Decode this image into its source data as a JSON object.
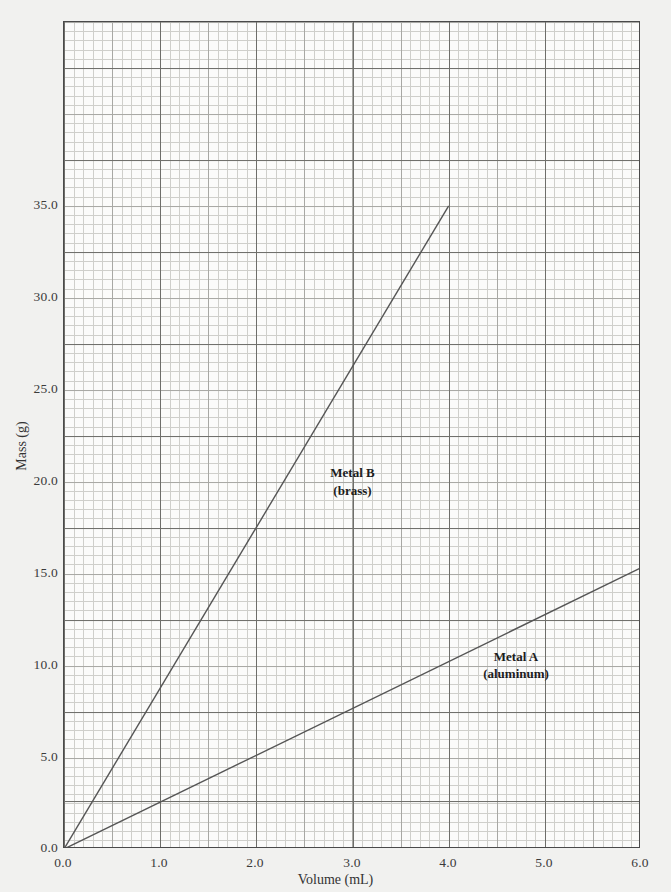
{
  "figure": {
    "background_color": "#f1f1ef",
    "plot_background_color": "#fbfbfa",
    "frame_color": "#4a4a4a"
  },
  "chart_data": {
    "type": "line",
    "title": "",
    "subtitle": "",
    "xlabel": "Volume (mL)",
    "ylabel": "Mass (g)",
    "xlim": [
      0.0,
      6.0
    ],
    "ylim": [
      0.0,
      45.0
    ],
    "xticks": [
      "0.0",
      "1.0",
      "2.0",
      "3.0",
      "4.0",
      "5.0",
      "6.0"
    ],
    "xtick_values": [
      0.0,
      1.0,
      2.0,
      3.0,
      4.0,
      5.0,
      6.0
    ],
    "yticks": [
      "0.0",
      "5.0",
      "10.0",
      "15.0",
      "20.0",
      "25.0",
      "30.0",
      "35.0"
    ],
    "ytick_values": [
      0.0,
      5.0,
      10.0,
      15.0,
      20.0,
      25.0,
      30.0,
      35.0
    ],
    "grid": "graph-paper: minor 0.1 mL / 0.5 g, medium every 0.5 mL / 2.5 g, major at labeled ticks",
    "legend_position": "inline annotations next to each line",
    "line_color": "#555555",
    "series": [
      {
        "name": "Metal B (brass)",
        "label_line1": "Metal B",
        "label_line2": "(brass)",
        "x": [
          0.0,
          4.0
        ],
        "values": [
          0.0,
          35.0
        ],
        "slope": 8.75,
        "slope_units": "g/mL",
        "label_x": 3.0,
        "label_y": 20.0
      },
      {
        "name": "Metal A (aluminum)",
        "label_line1": "Metal A",
        "label_line2": "(aluminum)",
        "x": [
          0.0,
          6.0
        ],
        "values": [
          0.0,
          15.3
        ],
        "slope": 2.55,
        "slope_units": "g/mL",
        "label_x": 4.7,
        "label_y": 10.0
      }
    ]
  }
}
